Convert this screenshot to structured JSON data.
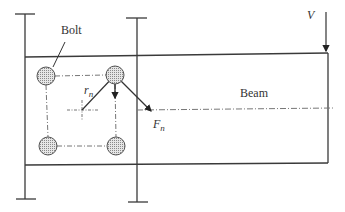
{
  "diagram": {
    "labels": {
      "bolt": "Bolt",
      "beam": "Beam",
      "load": "V",
      "radius": "r",
      "radius_sub": "n",
      "force": "F",
      "force_sub": "n"
    },
    "colors": {
      "line": "#3a3a3a",
      "bolt_fill": "#bdbdbd",
      "centerline": "#777777"
    },
    "bolts": [
      {
        "id": "top-left",
        "cx": 46,
        "cy": 76
      },
      {
        "id": "top-right",
        "cx": 115,
        "cy": 75
      },
      {
        "id": "bottom-left",
        "cx": 48,
        "cy": 146
      },
      {
        "id": "bottom-right",
        "cx": 116,
        "cy": 146
      }
    ],
    "centroid": {
      "x": 82,
      "y": 110
    }
  }
}
